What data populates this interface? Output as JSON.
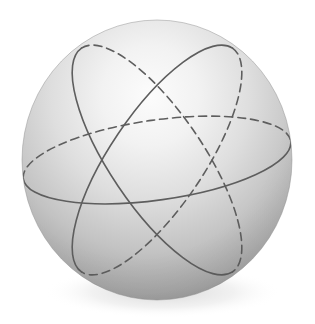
{
  "figure": {
    "background_color": "#ffffff",
    "canvas": {
      "width": 315,
      "height": 324
    }
  },
  "sphere": {
    "name": "shaded-sphere",
    "center": {
      "x": 157,
      "y": 160
    },
    "radius_x": 135,
    "radius_y": 140,
    "bounds": {
      "left": 22,
      "top": 20,
      "right": 292,
      "bottom": 300
    },
    "shading": {
      "type": "radial-gradient",
      "highlight": {
        "x": 150,
        "y": 95
      },
      "highlight_color": "#fbfbfb",
      "mid_color": "#d2d2d2",
      "edge_color": "#8e8e8e",
      "rim_color": "#7c7c7c"
    },
    "outline_color": "#8a8a8a"
  },
  "curves": {
    "stroke_color": "#5e5e5e",
    "stroke_width": 1.6,
    "dash_pattern": "8 5",
    "items": [
      {
        "id": "great-circle-equator",
        "label": "Equatorial great circle",
        "rotation_deg": -8,
        "radius_x": 135,
        "radius_y": 40,
        "front_style": "solid",
        "back_style": "dashed"
      },
      {
        "id": "great-circle-tilted-right",
        "label": "Tilted great circle (leaning right)",
        "rotation_deg": 56,
        "radius_x": 135,
        "radius_y": 47,
        "front_style": "solid",
        "back_style": "dashed"
      },
      {
        "id": "great-circle-tilted-left",
        "label": "Tilted great circle (leaning left)",
        "rotation_deg": 124,
        "radius_x": 135,
        "radius_y": 47,
        "front_style": "solid",
        "back_style": "dashed"
      }
    ]
  },
  "shadow": {
    "name": "contact-shadow",
    "color": "#c9c9c9",
    "opacity": 0.45
  }
}
